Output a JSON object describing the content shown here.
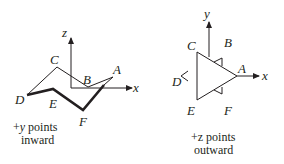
{
  "left_diagram": {
    "axes": {
      "vertical": "z",
      "horizontal": "x"
    },
    "vertices": [
      "A",
      "B",
      "C",
      "D",
      "E",
      "F"
    ],
    "caption_line1_sign": "+",
    "caption_line1_var": "y",
    "caption_line1_rest": " points",
    "caption_line2": "inward"
  },
  "right_diagram": {
    "axes": {
      "vertical": "y",
      "horizontal": "x"
    },
    "vertices": [
      "A",
      "B",
      "C",
      "D",
      "E",
      "F"
    ],
    "caption_line1": "+z points",
    "caption_line2": "outward"
  },
  "colors": {
    "ink": "#231f20",
    "background": "#ffffff"
  }
}
